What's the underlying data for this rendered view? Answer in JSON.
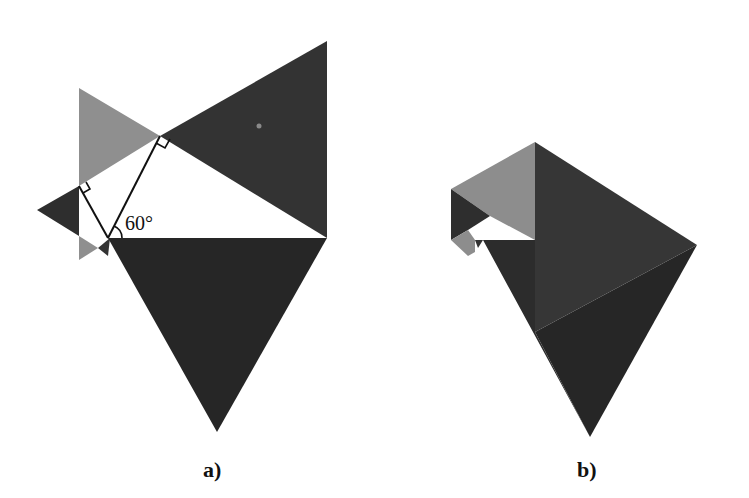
{
  "figures": [
    {
      "id": "a",
      "caption": "a)",
      "angle_label": "60°",
      "colors": {
        "dark": "#2b2b2b",
        "medium_dark": "#383838",
        "light_gray": "#8f8f8f",
        "white": "#ffffff",
        "line": "#111111"
      }
    },
    {
      "id": "b",
      "caption": "b)",
      "colors": {
        "dark": "#2a2a2a",
        "medium_dark": "#3a3a3a",
        "light_gray": "#8d8d8d"
      }
    }
  ]
}
